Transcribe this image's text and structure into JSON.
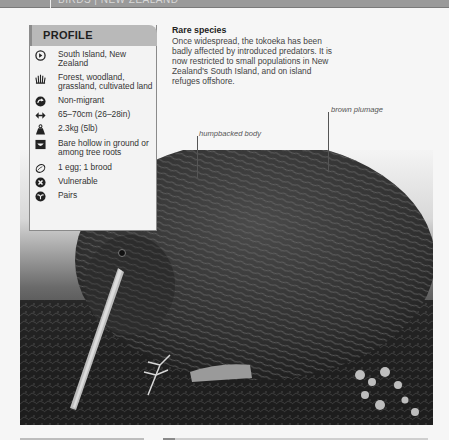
{
  "header": {
    "section_label": "BIRDS | NEW ZEALAND"
  },
  "profile": {
    "title": "PROFILE",
    "items": [
      {
        "icon": "range-icon",
        "text": "South Island, New Zealand"
      },
      {
        "icon": "habitat-icon",
        "text": "Forest, woodland, grassland, cultivated land"
      },
      {
        "icon": "migration-icon",
        "text": "Non-migrant"
      },
      {
        "icon": "length-icon",
        "text": "65–70cm (26–28in)"
      },
      {
        "icon": "weight-icon",
        "text": "2.3kg (5lb)"
      },
      {
        "icon": "nest-icon",
        "text": "Bare hollow in ground or among tree roots"
      },
      {
        "icon": "egg-icon",
        "text": "1 egg; 1 brood"
      },
      {
        "icon": "conservation-status-icon",
        "text": "Vulnerable"
      },
      {
        "icon": "social-unit-icon",
        "text": "Pairs"
      }
    ]
  },
  "rare_species": {
    "title": "Rare species",
    "body": "Once widespread, the tokoeka has been badly affected by introduced predators. It is now restricted to small populations in New Zealand's South Island, and on island refuges offshore."
  },
  "annotations": {
    "humpbacked": "humpbacked body",
    "plumage": "brown plumage"
  },
  "photo": {
    "subject": "Tokoeka (brown kiwi) foraging on forest floor",
    "colors": {
      "background": "#f4f4f4",
      "plumage": "#3a3a3a",
      "ground": "#1e1e1e",
      "beak": "#bdbdbd"
    }
  }
}
